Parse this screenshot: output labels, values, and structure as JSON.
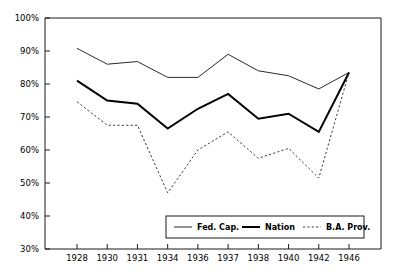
{
  "chart_data": {
    "type": "line",
    "title": "",
    "xlabel": "",
    "ylabel": "",
    "grid": false,
    "legend_position": "bottom-center",
    "categories": [
      "1928",
      "1930",
      "1931",
      "1934",
      "1936",
      "1937",
      "1938",
      "1940",
      "1942",
      "1946"
    ],
    "x": [
      1928,
      1930,
      1931,
      1934,
      1936,
      1937,
      1938,
      1940,
      1942,
      1946
    ],
    "ylim": [
      30,
      100
    ],
    "ytick_labels": [
      "30%",
      "40%",
      "50%",
      "60%",
      "70%",
      "80%",
      "90%",
      "100%"
    ],
    "ytick_values": [
      30,
      40,
      50,
      60,
      70,
      80,
      90,
      100
    ],
    "series": [
      {
        "name": "Fed. Cap.",
        "style": "solid-thin",
        "values": [
          90.8,
          86.0,
          86.8,
          82.0,
          82.0,
          89.0,
          84.0,
          82.5,
          78.5,
          83.5
        ]
      },
      {
        "name": "Nation",
        "style": "solid-thick",
        "values": [
          81.0,
          75.0,
          74.0,
          66.5,
          72.5,
          77.0,
          69.5,
          71.0,
          65.5,
          83.5
        ]
      },
      {
        "name": "B.A. Prov.",
        "style": "dashed",
        "values": [
          74.6,
          67.5,
          67.5,
          47.0,
          60.0,
          65.5,
          57.5,
          60.5,
          51.5,
          83.5
        ]
      }
    ]
  },
  "legend": {
    "items": [
      {
        "label": "Fed. Cap."
      },
      {
        "label": "Nation"
      },
      {
        "label": "B.A. Prov."
      }
    ]
  }
}
